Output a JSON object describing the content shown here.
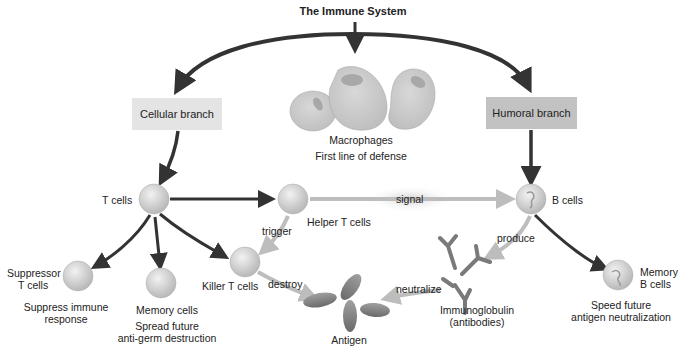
{
  "title": "The Immune System",
  "branches": {
    "cellular": "Cellular branch",
    "humoral": "Humoral branch"
  },
  "macrophages": {
    "name": "Macrophages",
    "description": "First line of defense"
  },
  "cells": {
    "t_cells": "T cells",
    "helper_t_cells": "Helper T cells",
    "b_cells": "B cells",
    "suppressor_line1": "Suppressor",
    "suppressor_line2": "T cells",
    "suppressor_desc_line1": "Suppress immune",
    "suppressor_desc_line2": "response",
    "memory_cells": "Memory cells",
    "memory_desc_line1": "Spread future",
    "memory_desc_line2": "anti-germ destruction",
    "killer_t_cells": "Killer T cells",
    "memory_b_line1": "Memory",
    "memory_b_line2": "B cells",
    "memory_b_desc_line1": "Speed future",
    "memory_b_desc_line2": "antigen neutralization",
    "immunoglobulin_line1": "Immunoglobulin",
    "immunoglobulin_line2": "(antibodies)",
    "antigen": "Antigen"
  },
  "actions": {
    "signal": "signal",
    "trigger": "trigger",
    "destroy": "destroy",
    "produce": "produce",
    "neutralize": "neutralize"
  },
  "colors": {
    "dark_arrow": "#333333",
    "light_arrow": "#bdbdbd",
    "cellular_box": "#e4e4e4",
    "humoral_box": "#c2c2c2",
    "cell_fill": "#dcdcdc",
    "antigen_fill": "#8a8a8a"
  }
}
